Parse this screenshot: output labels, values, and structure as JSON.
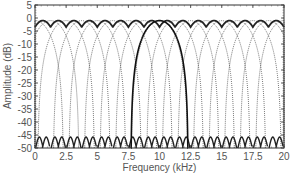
{
  "chart_data": {
    "type": "line",
    "title": "",
    "xlabel": "Frequency (kHz)",
    "ylabel": "Amplitude (dB)",
    "xlim": [
      0,
      20
    ],
    "ylim": [
      -50,
      5
    ],
    "xticks": [
      0,
      2.5,
      5,
      7.5,
      10,
      12.5,
      15,
      17.5,
      20
    ],
    "xtick_labels": [
      "0",
      "2.5",
      "5",
      "7.5",
      "10",
      "12.5",
      "15",
      "17.5",
      "20"
    ],
    "yticks": [
      5,
      0,
      -5,
      -10,
      -15,
      -20,
      -25,
      -30,
      -35,
      -40,
      -45,
      -50
    ],
    "ytick_labels": [
      "5",
      "0",
      "-5",
      "-10",
      "-15",
      "-20",
      "-25",
      "-30",
      "-35",
      "-40",
      "-45",
      "-50"
    ],
    "grid": false,
    "legend": null,
    "series": [
      {
        "name": "filter bank (dotted)",
        "style": "dotted",
        "color": "#555555",
        "centers_khz": [
          0,
          1.25,
          2.5,
          3.75,
          5,
          6.25,
          7.5,
          8.75,
          10,
          11.25,
          12.5,
          13.75,
          15,
          16.25,
          17.5,
          18.75,
          20
        ],
        "peak_db": -1,
        "half_width_khz": 2.3,
        "floor_db": -47
      },
      {
        "name": "summed envelope (bold)",
        "style": "solid",
        "color": "#222222",
        "peak_db": -1,
        "dip_db": -3.5,
        "period_khz": 1.25
      },
      {
        "name": "single filter highlighted (bold)",
        "style": "solid",
        "color": "#111111",
        "center_khz": 10,
        "peak_db": -1,
        "half_width_khz": 2.3,
        "floor_db": -50
      }
    ]
  }
}
